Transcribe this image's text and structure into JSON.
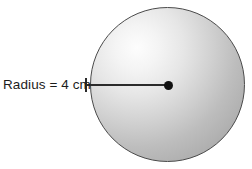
{
  "figure": {
    "type": "geometry-diagram",
    "background_color": "#ffffff",
    "label": {
      "text": "Radius = 4 cm",
      "quantity": "Radius",
      "equals": "=",
      "value": "4",
      "unit": "cm",
      "color": "#1c1c1c"
    },
    "circle": {
      "name": "shaded-circle",
      "center_x": 168,
      "center_y": 85,
      "radius_px": 77,
      "diameter_px": 155,
      "stroke_color": "#4a4a4a",
      "fill_light_color": "#fdfdfd",
      "fill_dark_color": "#a4a4a4",
      "shading": "radial-gradient light upper-left to gray lower-right"
    },
    "center_point": {
      "name": "center-dot",
      "x": 168,
      "y": 85,
      "color": "#111111"
    },
    "radius_line": {
      "name": "radius-segment",
      "from_x": 86,
      "to_x": 168,
      "y": 85,
      "color": "#2b2b2b",
      "orientation": "horizontal"
    }
  }
}
